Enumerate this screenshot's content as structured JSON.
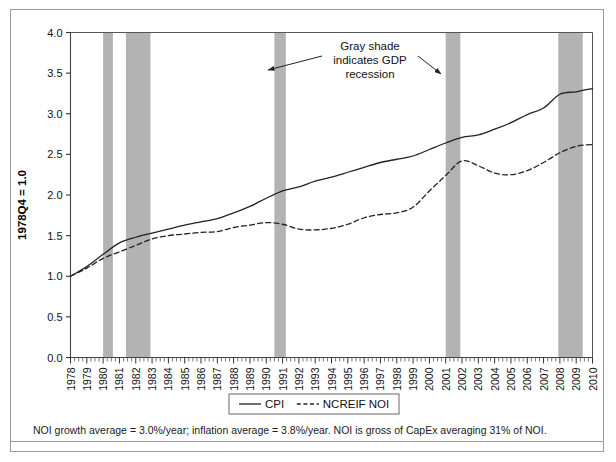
{
  "chart_data": {
    "type": "line",
    "title": "",
    "xlabel": "",
    "ylabel": "1978Q4 = 1.0",
    "xlim": [
      1978,
      2010
    ],
    "ylim": [
      0.0,
      4.0
    ],
    "grid": false,
    "legend_position": "bottom-center",
    "y_ticks": [
      "0.0",
      "0.5",
      "1.0",
      "1.5",
      "2.0",
      "2.5",
      "3.0",
      "3.5",
      "4.0"
    ],
    "y_tick_values": [
      0.0,
      0.5,
      1.0,
      1.5,
      2.0,
      2.5,
      3.0,
      3.5,
      4.0
    ],
    "x_ticks": [
      "1978",
      "1979",
      "1980",
      "1981",
      "1982",
      "1983",
      "1984",
      "1985",
      "1986",
      "1987",
      "1988",
      "1989",
      "1990",
      "1991",
      "1992",
      "1993",
      "1994",
      "1995",
      "1996",
      "1997",
      "1998",
      "1999",
      "2000",
      "2001",
      "2002",
      "2003",
      "2004",
      "2005",
      "2006",
      "2007",
      "2008",
      "2009",
      "2010"
    ],
    "x": [
      1978,
      1979,
      1980,
      1981,
      1982,
      1983,
      1984,
      1985,
      1986,
      1987,
      1988,
      1989,
      1990,
      1991,
      1992,
      1993,
      1994,
      1995,
      1996,
      1997,
      1998,
      1999,
      2000,
      2001,
      2002,
      2003,
      2004,
      2005,
      2006,
      2007,
      2008,
      2009,
      2010
    ],
    "series": [
      {
        "name": "CPI",
        "style": "solid",
        "color": "#222222",
        "values": [
          1.0,
          1.12,
          1.27,
          1.41,
          1.48,
          1.53,
          1.58,
          1.63,
          1.67,
          1.71,
          1.78,
          1.86,
          1.96,
          2.05,
          2.1,
          2.17,
          2.22,
          2.28,
          2.34,
          2.4,
          2.44,
          2.48,
          2.56,
          2.64,
          2.71,
          2.74,
          2.81,
          2.89,
          2.99,
          3.07,
          3.24,
          3.27,
          3.31
        ]
      },
      {
        "name": "NCREIF NOI",
        "style": "dashed",
        "color": "#222222",
        "values": [
          1.0,
          1.1,
          1.22,
          1.3,
          1.38,
          1.46,
          1.5,
          1.52,
          1.54,
          1.55,
          1.6,
          1.63,
          1.66,
          1.64,
          1.58,
          1.57,
          1.59,
          1.64,
          1.72,
          1.76,
          1.78,
          1.85,
          2.05,
          2.24,
          2.42,
          2.36,
          2.27,
          2.25,
          2.3,
          2.4,
          2.52,
          2.6,
          2.62
        ]
      }
    ],
    "shaded_regions": {
      "label": "GDP recession",
      "color": "#b3b3b3",
      "spans": [
        [
          1980.0,
          1980.6
        ],
        [
          1981.4,
          1982.9
        ],
        [
          1990.5,
          1991.2
        ],
        [
          2001.0,
          2001.9
        ],
        [
          2007.9,
          2009.4
        ]
      ]
    },
    "annotations": [
      {
        "name": "recession-annotation",
        "lines": [
          "Gray shade",
          "indicates GDP",
          "recession"
        ]
      }
    ]
  },
  "legend": {
    "entries": [
      {
        "label": "CPI",
        "style": "solid"
      },
      {
        "label": "NCREIF NOI",
        "style": "dashed"
      }
    ]
  },
  "footnote": {
    "text": "NOI growth average = 3.0%/year; inflation average = 3.8%/year. NOI is gross of CapEx averaging 31% of NOI."
  }
}
